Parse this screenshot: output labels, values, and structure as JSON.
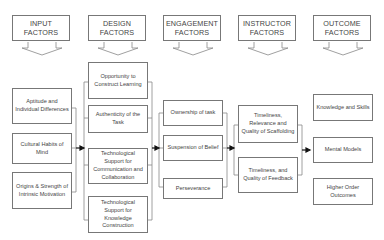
{
  "headers": [
    {
      "id": "input",
      "label": "INPUT\nFACTORS"
    },
    {
      "id": "design",
      "label": "DESIGN\nFACTORS"
    },
    {
      "id": "engagement",
      "label": "ENGAGEMENT\nFACTORS"
    },
    {
      "id": "instructor",
      "label": "INSTRUCTOR\nFACTORS"
    },
    {
      "id": "outcome",
      "label": "OUTCOME\nFACTORS"
    }
  ],
  "columns": {
    "input": [
      "Aptitude and Individual Differences",
      "Cultural Habits of Mind",
      "Origins & Strength of Intrinsic Motivation"
    ],
    "design": [
      "Opportunity to Construct Learning",
      "Authenticity of the Task",
      "Technological Support for Communication and Collaboration",
      "Technological Support for Knowledge Construction"
    ],
    "engagement": [
      "Ownership of task",
      "Suspension of Belief",
      "Perseverance"
    ],
    "instructor": [
      "Timeliness, Relevance and Quality of Scaffolding",
      "Timeliness, and Quality of Feedback"
    ],
    "outcome": [
      "Knowledge and Skills",
      "Mental Models",
      "Higher Order Outcomes"
    ]
  },
  "colors": {
    "stroke": "#777777",
    "text": "#444444",
    "arrow": "#111111",
    "background": "#ffffff"
  }
}
